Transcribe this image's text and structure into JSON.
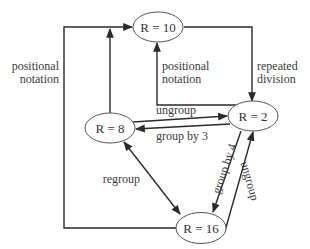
{
  "diagram": {
    "type": "directed-graph",
    "nodes": [
      {
        "id": "r10",
        "label": "R = 10"
      },
      {
        "id": "r8",
        "label": "R = 8"
      },
      {
        "id": "r2",
        "label": "R = 2"
      },
      {
        "id": "r16",
        "label": "R = 16"
      }
    ],
    "edges": [
      {
        "id": "e1",
        "from": "R = 8",
        "to": "R = 10",
        "label": ""
      },
      {
        "id": "e2",
        "from": "R = 16",
        "to": "R = 10",
        "label": "positional\nnotation",
        "label_lines": [
          "positional",
          "notation"
        ]
      },
      {
        "id": "e3",
        "from": "R = 2",
        "to": "R = 10",
        "label": "positional\nnotation",
        "label_lines": [
          "positional",
          "notation"
        ]
      },
      {
        "id": "e4",
        "from": "R = 10",
        "to": "R = 2",
        "label": "repeated\ndivision",
        "label_lines": [
          "repeated",
          "division"
        ]
      },
      {
        "id": "e5",
        "from": "R = 8",
        "to": "R = 2",
        "label": "ungroup"
      },
      {
        "id": "e6",
        "from": "R = 2",
        "to": "R = 8",
        "label": "group by 3"
      },
      {
        "id": "e7",
        "from": "R = 8",
        "to": "R = 16",
        "label": "regroup",
        "bidirectional": true
      },
      {
        "id": "e8",
        "from": "R = 2",
        "to": "R = 16",
        "label": "group by 4"
      },
      {
        "id": "e9",
        "from": "R = 16",
        "to": "R = 2",
        "label": "ungroup"
      }
    ]
  },
  "labels": {
    "left_positional_1": "positional",
    "left_positional_2": "notation",
    "inner_positional_1": "positional",
    "inner_positional_2": "notation",
    "repeated_1": "repeated",
    "repeated_2": "division",
    "ungroup_top": "ungroup",
    "group_by_3": "group by 3",
    "regroup": "regroup",
    "group_by_4": "group by 4",
    "ungroup_right": "ungroup"
  },
  "colors": {
    "line": "#2a2a2a",
    "node_border": "#555555",
    "text": "#333333",
    "background": "#ffffff"
  }
}
